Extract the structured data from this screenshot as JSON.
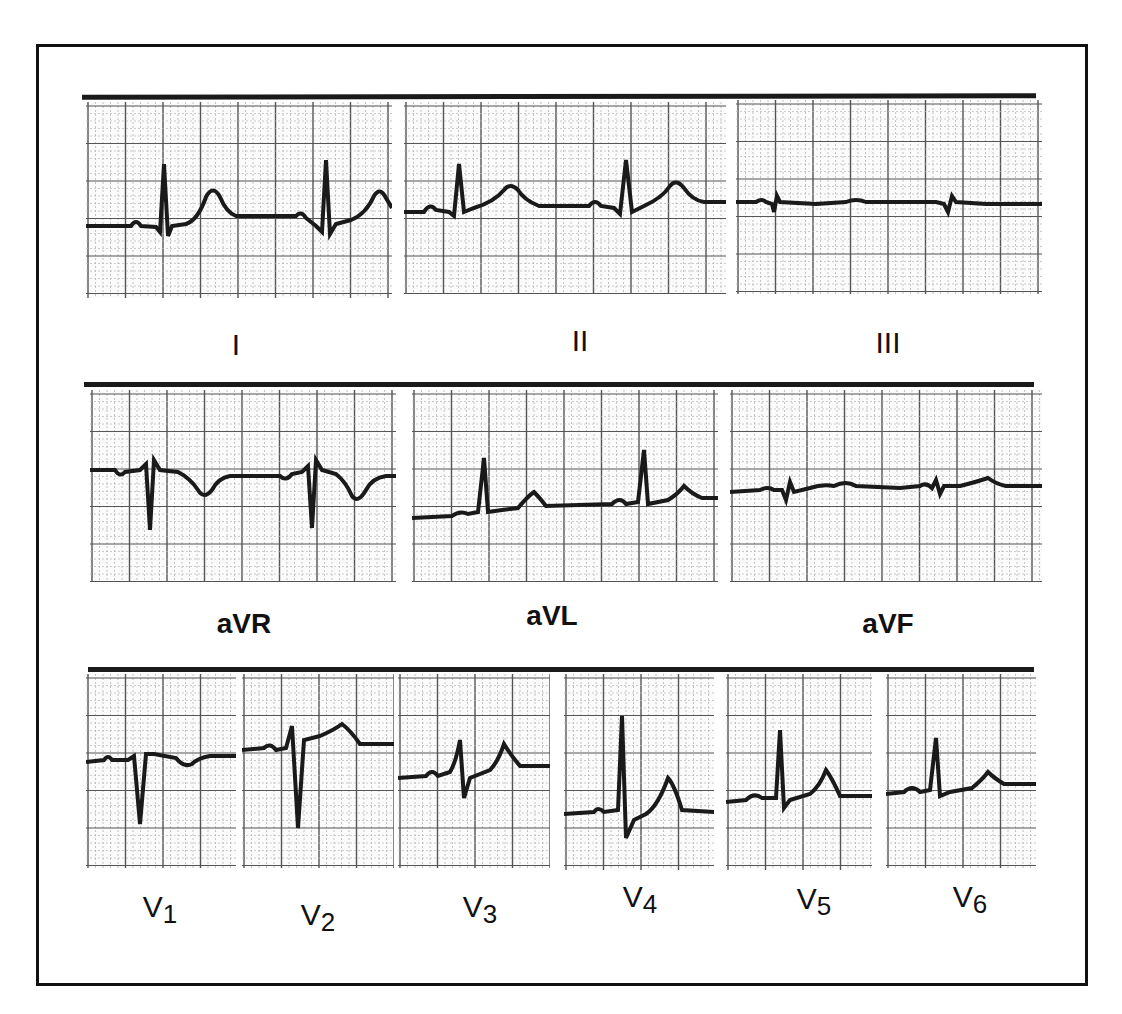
{
  "figure": {
    "title": "",
    "rows": [
      {
        "leads": [
          {
            "id": "I",
            "label": "I"
          },
          {
            "id": "II",
            "label": "II"
          },
          {
            "id": "III",
            "label": "III"
          }
        ]
      },
      {
        "leads": [
          {
            "id": "aVR",
            "label": "aVR"
          },
          {
            "id": "aVL",
            "label": "aVL"
          },
          {
            "id": "aVF",
            "label": "aVF"
          }
        ]
      },
      {
        "leads": [
          {
            "id": "V1",
            "label": "V",
            "sub": "1"
          },
          {
            "id": "V2",
            "label": "V",
            "sub": "2"
          },
          {
            "id": "V3",
            "label": "V",
            "sub": "3"
          },
          {
            "id": "V4",
            "label": "V",
            "sub": "4"
          },
          {
            "id": "V5",
            "label": "V",
            "sub": "5"
          },
          {
            "id": "V6",
            "label": "V",
            "sub": "6"
          }
        ]
      }
    ]
  },
  "colors": {
    "trace": "#1a1a1a",
    "grid_major": "#555555",
    "grid_minor": "#b8b8b8",
    "border": "#111111"
  }
}
